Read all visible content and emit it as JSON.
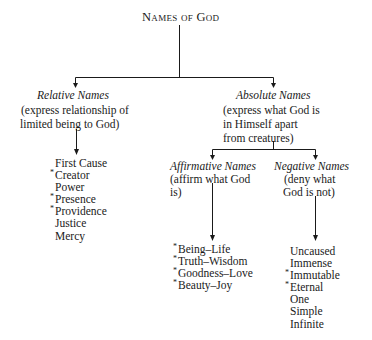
{
  "title": "Names of God",
  "relative": {
    "heading": "Relative Names",
    "description": [
      "(express relationship of",
      "limited being to God)"
    ],
    "items": [
      {
        "label": "First Cause",
        "marked": false
      },
      {
        "label": "Creator",
        "marked": true
      },
      {
        "label": "Power",
        "marked": false
      },
      {
        "label": "Presence",
        "marked": true
      },
      {
        "label": "Providence",
        "marked": true
      },
      {
        "label": "Justice",
        "marked": false
      },
      {
        "label": "Mercy",
        "marked": false
      }
    ]
  },
  "absolute": {
    "heading": "Absolute Names",
    "description": [
      "(express what God is",
      "in Himself apart",
      "from creatures)"
    ],
    "affirmative": {
      "heading": "Affirmative Names",
      "description": [
        "(affirm what God",
        "is)"
      ],
      "items": [
        {
          "label": "Being–Life",
          "marked": true
        },
        {
          "label": "Truth–Wisdom",
          "marked": true
        },
        {
          "label": "Goodness–Love",
          "marked": true
        },
        {
          "label": "Beauty–Joy",
          "marked": true
        }
      ]
    },
    "negative": {
      "heading": "Negative Names",
      "description": [
        "(deny what",
        "God is not)"
      ],
      "items": [
        {
          "label": "Uncaused",
          "marked": false
        },
        {
          "label": "Immense",
          "marked": false
        },
        {
          "label": "Immutable",
          "marked": true
        },
        {
          "label": "Eternal",
          "marked": true
        },
        {
          "label": "One",
          "marked": false
        },
        {
          "label": "Simple",
          "marked": false
        },
        {
          "label": "Infinite",
          "marked": false
        }
      ]
    }
  },
  "marker": "*"
}
